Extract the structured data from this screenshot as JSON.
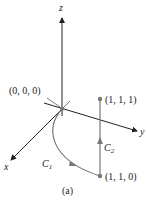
{
  "figure": {
    "caption": "(a)",
    "axes": {
      "x_label": "x",
      "y_label": "y",
      "z_label": "z"
    },
    "points": [
      {
        "id": "origin",
        "label": "(0, 0, 0)"
      },
      {
        "id": "p111",
        "label": "(1, 1, 1)"
      },
      {
        "id": "p110",
        "label": "(1, 1, 0)"
      }
    ],
    "curves": [
      {
        "id": "c1",
        "label_base": "C",
        "label_sub": "1"
      },
      {
        "id": "c2",
        "label_base": "C",
        "label_sub": "2"
      }
    ],
    "colors": {
      "axis": "#222222",
      "curve": "#777777",
      "point": "#777777"
    }
  }
}
